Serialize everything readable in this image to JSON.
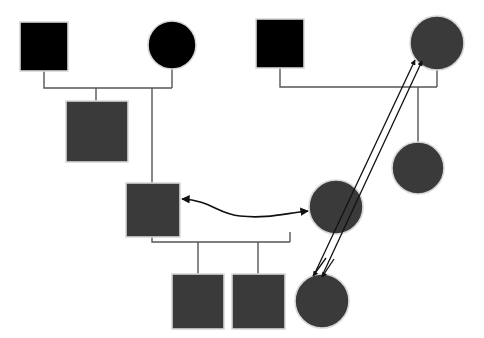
{
  "diagram": {
    "type": "pedigree-chart",
    "title": "",
    "canvas": {
      "width": 484,
      "height": 338,
      "background": "#ffffff"
    },
    "colors": {
      "affected_fill": "#000000",
      "unaffected_fill": "#3a3a3a",
      "shape_stroke": "#d8d8d8",
      "line_stroke": "#555555",
      "arrow_stroke": "#111111"
    },
    "legend_note": "",
    "symbols": {
      "square_meaning": "male",
      "circle_meaning": "female",
      "black_fill_meaning": "affected",
      "gray_fill_meaning": "unaffected"
    }
  },
  "individuals": [
    {
      "id": "I-1",
      "shape": "square",
      "sex": "male",
      "fill": "#000000",
      "x": 20,
      "y": 22,
      "w": 48,
      "h": 49,
      "generation": 1,
      "label": ""
    },
    {
      "id": "I-2",
      "shape": "circle",
      "sex": "female",
      "fill": "#000000",
      "cx": 172,
      "cy": 45,
      "r": 24,
      "generation": 1,
      "label": ""
    },
    {
      "id": "I-3",
      "shape": "square",
      "sex": "male",
      "fill": "#000000",
      "x": 256,
      "y": 19,
      "w": 48,
      "h": 49,
      "generation": 1,
      "label": ""
    },
    {
      "id": "I-4",
      "shape": "circle",
      "sex": "female",
      "fill": "#3a3a3a",
      "cx": 437,
      "cy": 43,
      "r": 27,
      "generation": 1,
      "label": ""
    },
    {
      "id": "II-1",
      "shape": "square",
      "sex": "male",
      "fill": "#3a3a3a",
      "x": 66,
      "y": 101,
      "w": 62,
      "h": 61,
      "generation": 2,
      "label": ""
    },
    {
      "id": "II-2",
      "shape": "square",
      "sex": "male",
      "fill": "#3a3a3a",
      "x": 126,
      "y": 183,
      "w": 54,
      "h": 54,
      "generation": 2,
      "label": ""
    },
    {
      "id": "II-3",
      "shape": "circle",
      "sex": "female",
      "fill": "#3a3a3a",
      "cx": 336,
      "cy": 207,
      "r": 27,
      "generation": 2,
      "label": ""
    },
    {
      "id": "II-4",
      "shape": "circle",
      "sex": "female",
      "fill": "#3a3a3a",
      "cx": 418,
      "cy": 168,
      "r": 26,
      "generation": 2,
      "label": ""
    },
    {
      "id": "III-1",
      "shape": "square",
      "sex": "male",
      "fill": "#3a3a3a",
      "x": 172,
      "y": 274,
      "w": 52,
      "h": 55,
      "generation": 3,
      "label": ""
    },
    {
      "id": "III-2",
      "shape": "square",
      "sex": "male",
      "fill": "#3a3a3a",
      "x": 232,
      "y": 274,
      "w": 53,
      "h": 55,
      "generation": 3,
      "label": ""
    },
    {
      "id": "III-3",
      "shape": "circle",
      "sex": "female",
      "fill": "#3a3a3a",
      "cx": 322,
      "cy": 301,
      "r": 27,
      "generation": 3,
      "label": ""
    }
  ],
  "unions": [
    {
      "id": "U-1",
      "partners": [
        "I-1",
        "I-2"
      ],
      "children": [
        "II-1",
        "II-2"
      ],
      "line_y": 88
    },
    {
      "id": "U-2",
      "partners": [
        "I-3",
        "I-4"
      ],
      "children": [
        "II-4"
      ],
      "line_y": 87
    },
    {
      "id": "U-3",
      "partners": [
        "II-2",
        "II-3"
      ],
      "children": [
        "III-1",
        "III-2",
        "III-3"
      ],
      "line_y": 242
    }
  ],
  "annotations": [
    {
      "id": "A-1",
      "kind": "double-line-arrow",
      "from": "III-3",
      "to": "I-4",
      "arrowheads": "both-ends-at-targets",
      "description": "paired parallel lines with arrowheads at the top-right circle and at the bottom-right circle",
      "label": ""
    },
    {
      "id": "A-2",
      "kind": "curved-double-headed-arrow",
      "from": "II-2",
      "to": "II-3",
      "arrowheads": "both",
      "description": "S-curved arrow linking the middle square and the middle-right circle",
      "label": ""
    }
  ]
}
